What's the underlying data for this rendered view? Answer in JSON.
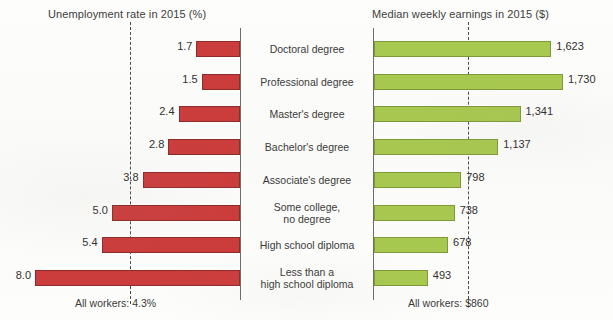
{
  "chart_data": {
    "type": "bar",
    "subtype": "back-to-back-bar",
    "title": "",
    "categories": [
      "Doctoral degree",
      "Professional degree",
      "Master's degree",
      "Bachelor's degree",
      "Associate's degree",
      "Some college,\nno degree",
      "High school diploma",
      "Less than a\nhigh school diploma"
    ],
    "panels": [
      {
        "id": "unemployment",
        "title": "Unemployment rate in 2015 (%)",
        "ylabel": "",
        "xlabel": "Unemployment rate (%)",
        "direction": "left",
        "color": "#cc3c3c",
        "values": [
          1.7,
          1.5,
          2.4,
          2.8,
          3.8,
          5.0,
          5.4,
          8.0
        ],
        "value_labels": [
          "1.7",
          "1.5",
          "2.4",
          "2.8",
          "3.8",
          "5.0",
          "5.4",
          "8.0"
        ],
        "xlim": [
          0,
          8.0
        ],
        "reference_line": {
          "value": 4.3,
          "label": "All workers: 4.3%",
          "style": "dashed"
        }
      },
      {
        "id": "earnings",
        "title": "Median weekly earnings in 2015 ($)",
        "ylabel": "",
        "xlabel": "Median weekly earnings ($)",
        "direction": "right",
        "color": "#a8c94f",
        "values": [
          1623,
          1730,
          1341,
          1137,
          798,
          738,
          678,
          493
        ],
        "value_labels": [
          "1,623",
          "1,730",
          "1,341",
          "1,137",
          "798",
          "738",
          "678",
          "493"
        ],
        "xlim": [
          0,
          1730
        ],
        "reference_line": {
          "value": 860,
          "label": "All workers: $860",
          "style": "dashed"
        }
      }
    ],
    "grid": false,
    "legend": "none"
  },
  "titles": {
    "left": "Unemployment rate in 2015 (%)",
    "right": "Median weekly earnings in 2015 ($)"
  },
  "footnotes": {
    "left": "All workers: 4.3%",
    "right": "All workers: $860"
  },
  "colors": {
    "unemployment_bar": "#cc3c3c",
    "unemployment_bar_edge": "#8e2b2b",
    "earnings_bar": "#a8c94f",
    "earnings_bar_edge": "#7f9a38",
    "axis": "#6d6d6d",
    "reference_line": "#4a4a4a",
    "background": "#fdfdfb",
    "text": "#3a3a3a"
  }
}
